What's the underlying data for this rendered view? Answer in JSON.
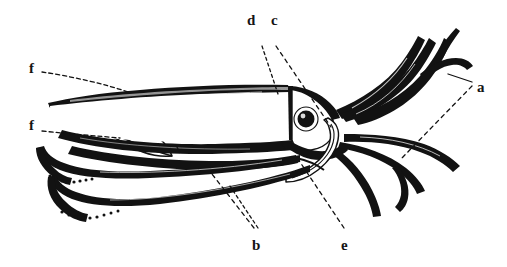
{
  "figure": {
    "kind": "line-engraving",
    "background_color": "#ffffff",
    "ink_color": "#121212",
    "width": 507,
    "height": 267
  },
  "labels": [
    {
      "id": "label-d",
      "text": "d",
      "x": 247,
      "y": 13,
      "name": "label-d-mantle"
    },
    {
      "id": "label-c",
      "text": "c",
      "x": 271,
      "y": 13,
      "name": "label-c-head"
    },
    {
      "id": "label-a",
      "text": "a",
      "x": 477,
      "y": 80,
      "name": "label-a-arms"
    },
    {
      "id": "label-f-upper",
      "text": "f",
      "x": 29,
      "y": 61,
      "name": "label-f-fin-upper"
    },
    {
      "id": "label-f-lower",
      "text": "f",
      "x": 29,
      "y": 118,
      "name": "label-f-fin-lower"
    },
    {
      "id": "label-b",
      "text": "b",
      "x": 252,
      "y": 238,
      "name": "label-b-tentacle"
    },
    {
      "id": "label-e",
      "text": "e",
      "x": 341,
      "y": 238,
      "name": "label-e-funnel"
    }
  ],
  "leader_lines": [
    {
      "name": "leader-line-d",
      "from_label": "d",
      "style": "dashed"
    },
    {
      "name": "leader-line-c",
      "from_label": "c",
      "style": "dashed"
    },
    {
      "name": "leader-line-a-solid",
      "from_label": "a",
      "style": "solid"
    },
    {
      "name": "leader-line-a-dashed",
      "from_label": "a",
      "style": "dashed"
    },
    {
      "name": "leader-line-f-upper",
      "from_label": "f",
      "style": "dashed"
    },
    {
      "name": "leader-line-f-lower",
      "from_label": "f",
      "style": "dashed"
    },
    {
      "name": "leader-line-b-1",
      "from_label": "b",
      "style": "dashed"
    },
    {
      "name": "leader-line-b-2",
      "from_label": "b",
      "style": "dashed"
    },
    {
      "name": "leader-line-e",
      "from_label": "e",
      "style": "dashed"
    }
  ],
  "anatomy_parts": [
    {
      "name": "tail-fin",
      "label_ref": "f"
    },
    {
      "name": "mantle",
      "label_ref": "d"
    },
    {
      "name": "head",
      "label_ref": "c"
    },
    {
      "name": "eye",
      "label_ref": "c"
    },
    {
      "name": "funnel",
      "label_ref": "e"
    },
    {
      "name": "arms",
      "label_ref": "a"
    },
    {
      "name": "feeding-tentacles",
      "label_ref": "b"
    }
  ]
}
